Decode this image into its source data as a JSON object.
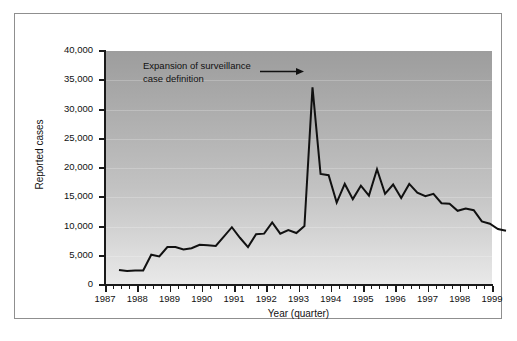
{
  "chart_data": {
    "type": "line",
    "title": "",
    "xlabel": "Year (quarter)",
    "ylabel": "Reported cases",
    "ylim": [
      0,
      40000
    ],
    "ytick_labels": [
      "40,000",
      "35,000",
      "30,000",
      "25,000",
      "20,000",
      "15,000",
      "10,000",
      "5,000",
      "0"
    ],
    "ytick_values": [
      40000,
      35000,
      30000,
      25000,
      20000,
      15000,
      10000,
      5000,
      0
    ],
    "xtick_labels": [
      "1987",
      "1988",
      "1989",
      "1990",
      "1991",
      "1992",
      "1993",
      "1994",
      "1995",
      "1996",
      "1997",
      "1998",
      "1999"
    ],
    "xtick_values": [
      1987,
      1988,
      1989,
      1990,
      1991,
      1992,
      1993,
      1994,
      1995,
      1996,
      1997,
      1998,
      1999
    ],
    "xlim": [
      1987.0,
      1999.0
    ],
    "grid": true,
    "legend": "none",
    "minor_ticks_per_year": 4,
    "annotations": [
      {
        "text_line1": "Expansion of surveillance",
        "text_line2": "case definition",
        "points_to_x": 1993.0,
        "points_to_y": 36000
      }
    ],
    "series": [
      {
        "name": "Reported cases",
        "color": "#111111",
        "x": [
          1987.0,
          1987.25,
          1987.5,
          1987.75,
          1988.0,
          1988.25,
          1988.5,
          1988.75,
          1989.0,
          1989.25,
          1989.5,
          1989.75,
          1990.0,
          1990.25,
          1990.5,
          1990.75,
          1991.0,
          1991.25,
          1991.5,
          1991.75,
          1992.0,
          1992.25,
          1992.5,
          1992.75,
          1993.0,
          1993.25,
          1993.5,
          1993.75,
          1994.0,
          1994.25,
          1994.5,
          1994.75,
          1995.0,
          1995.25,
          1995.5,
          1995.75,
          1996.0,
          1996.25,
          1996.5,
          1996.75,
          1997.0,
          1997.25,
          1997.5,
          1997.75,
          1998.0,
          1998.25,
          1998.5,
          1998.75,
          1999.0
        ],
        "y": [
          4800,
          4600,
          4700,
          4700,
          7400,
          7100,
          8700,
          8700,
          8300,
          8500,
          9100,
          9000,
          8900,
          10500,
          12100,
          10300,
          8700,
          10900,
          11000,
          12900,
          11000,
          11600,
          11100,
          12300,
          36000,
          21200,
          21000,
          16300,
          19500,
          16900,
          19200,
          17500,
          22000,
          17800,
          19400,
          17100,
          19500,
          18000,
          17400,
          17800,
          16200,
          16100,
          14900,
          15300,
          15000,
          13100,
          12700,
          11800,
          11500
        ]
      }
    ]
  },
  "figure": {
    "background_color": "#ffffff",
    "plot_top_color": "#9d9d9d",
    "plot_bottom_color": "#e9e9e9",
    "line_color": "#111111",
    "border_color": "#8f8f8f"
  }
}
